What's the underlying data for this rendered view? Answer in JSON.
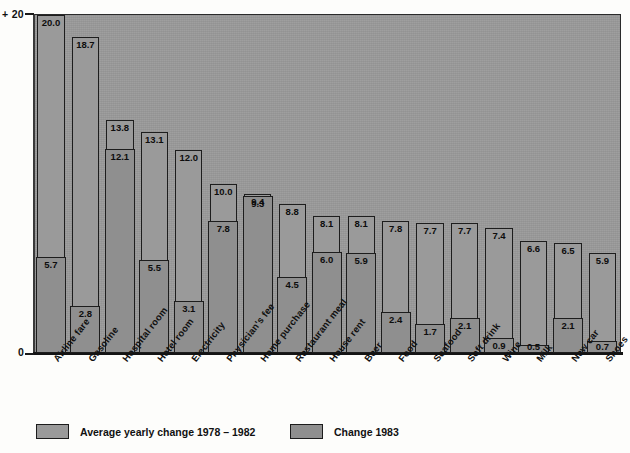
{
  "chart_data": {
    "type": "bar",
    "title": "",
    "subtitle": "",
    "xlabel": "",
    "ylabel": "",
    "ylim": [
      0,
      20
    ],
    "ytick_labels": [
      "+ 20",
      "0"
    ],
    "ytick_values": [
      20,
      0
    ],
    "grid": false,
    "legend_position": "bottom",
    "orientation": "vertical",
    "style": "nested/overlay bars, grayscale scan",
    "categories": [
      "Airline fare",
      "Gasoline",
      "Hospital room",
      "Hotel room",
      "Electricity",
      "Physician's fee",
      "Home purchase",
      "Restaurant meal",
      "House rent",
      "Beer",
      "Food",
      "Seafood",
      "Soft drink",
      "Wine",
      "Milk",
      "New car",
      "Shoes"
    ],
    "series": [
      {
        "name": "Average yearly change 1978 – 1982",
        "values": [
          20.0,
          18.7,
          13.8,
          13.1,
          12.0,
          10.0,
          9.4,
          8.8,
          8.1,
          8.1,
          7.8,
          7.7,
          7.7,
          7.4,
          6.6,
          6.5,
          5.9
        ]
      },
      {
        "name": "Change 1983",
        "values": [
          5.7,
          2.8,
          12.1,
          5.5,
          3.1,
          7.8,
          9.3,
          4.5,
          6.0,
          5.9,
          2.4,
          1.7,
          2.1,
          0.9,
          0.5,
          2.1,
          0.7
        ]
      }
    ],
    "bar_labels_outer": [
      "20.0",
      "18.7",
      "13.8",
      "13.1",
      "12.0",
      "10.0",
      "9.4",
      "8.8",
      "8.1",
      "8.1",
      "7.8",
      "7.7",
      "7.7",
      "7.4",
      "6.6",
      "6.5",
      "5.9"
    ],
    "bar_labels_inner": [
      "5.7",
      "2.8",
      "12.1",
      "5.5",
      "3.1",
      "7.8",
      "9.3",
      "4.5",
      "6.0",
      "5.9",
      "2.4",
      "1.7",
      "2.1",
      "0.9",
      "0.5",
      "2.1",
      "0.7"
    ],
    "colors": {
      "panel_background": "#9a9a9a",
      "bar_fill_average": "#9a9a9a",
      "bar_fill_1983": "#8f8f8f",
      "bar_outline": "#1d1d1d",
      "axis": "#141414",
      "text": "#0d0d0d"
    }
  },
  "axis": {
    "top_tick_label": "+ 20",
    "zero_tick_label": "0"
  },
  "legend": {
    "items": [
      {
        "label": "Average yearly change 1978 – 1982",
        "swatch": "gray-light-swatch"
      },
      {
        "label": "Change 1983",
        "swatch": "gray-dark-swatch"
      }
    ]
  }
}
